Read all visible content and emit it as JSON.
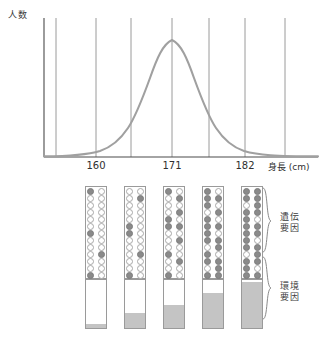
{
  "figure": {
    "y_axis_label": "人数",
    "x_axis_title": "身長 (cm)",
    "x_ticks": [
      "160",
      "171",
      "182"
    ]
  },
  "chart_data": {
    "type": "line",
    "title": "",
    "xlabel": "身長 (cm)",
    "ylabel": "人数",
    "grid": true,
    "legend": "none",
    "x_tick_labels": [
      "160",
      "171",
      "182"
    ],
    "x_tick_positions_px": [
      96,
      172,
      245
    ],
    "gridline_positions_px": [
      56,
      96,
      131,
      172,
      209,
      245,
      285
    ],
    "xlim": [
      140,
      202
    ],
    "ylim": [
      0,
      1
    ],
    "series": [
      {
        "name": "身長の分布",
        "color": "#a0a0a0",
        "x": [
          140,
          144,
          148,
          152,
          155,
          158,
          160,
          163,
          166,
          168,
          171,
          174,
          176,
          179,
          182,
          185,
          188,
          192,
          196,
          200
        ],
        "y": [
          0.005,
          0.012,
          0.025,
          0.055,
          0.1,
          0.19,
          0.27,
          0.46,
          0.68,
          0.85,
          1.0,
          0.9,
          0.76,
          0.51,
          0.3,
          0.16,
          0.08,
          0.025,
          0.009,
          0.004
        ]
      }
    ],
    "annotations": [
      "Normal distribution of human height",
      "Five sample columns below show genetic vs environmental contribution"
    ]
  },
  "columns": {
    "count": 5,
    "genetic": {
      "rows": 13,
      "dots_per_row": 2,
      "label_group": "遺伝要因",
      "filled_counts": [
        4,
        5,
        7,
        12,
        20
      ],
      "patterns": [
        [
          [
            1,
            0
          ],
          [
            0,
            0
          ],
          [
            0,
            0
          ],
          [
            0,
            0
          ],
          [
            0,
            0
          ],
          [
            0,
            0
          ],
          [
            1,
            0
          ],
          [
            0,
            0
          ],
          [
            0,
            0
          ],
          [
            0,
            1
          ],
          [
            0,
            0
          ],
          [
            0,
            0
          ],
          [
            1,
            0
          ]
        ],
        [
          [
            0,
            0
          ],
          [
            0,
            1
          ],
          [
            0,
            0
          ],
          [
            0,
            0
          ],
          [
            0,
            0
          ],
          [
            1,
            0
          ],
          [
            1,
            0
          ],
          [
            0,
            0
          ],
          [
            0,
            0
          ],
          [
            0,
            1
          ],
          [
            0,
            0
          ],
          [
            0,
            0
          ],
          [
            1,
            0
          ]
        ],
        [
          [
            1,
            0
          ],
          [
            0,
            1
          ],
          [
            0,
            0
          ],
          [
            0,
            1
          ],
          [
            1,
            0
          ],
          [
            1,
            1
          ],
          [
            0,
            0
          ],
          [
            0,
            1
          ],
          [
            0,
            0
          ],
          [
            1,
            0
          ],
          [
            0,
            1
          ],
          [
            0,
            0
          ],
          [
            1,
            0
          ]
        ],
        [
          [
            1,
            0
          ],
          [
            1,
            1
          ],
          [
            1,
            0
          ],
          [
            0,
            1
          ],
          [
            1,
            0
          ],
          [
            1,
            1
          ],
          [
            1,
            0
          ],
          [
            1,
            1
          ],
          [
            0,
            1
          ],
          [
            1,
            0
          ],
          [
            1,
            1
          ],
          [
            0,
            1
          ],
          [
            1,
            1
          ]
        ],
        [
          [
            1,
            1
          ],
          [
            1,
            1
          ],
          [
            0,
            1
          ],
          [
            1,
            1
          ],
          [
            1,
            0
          ],
          [
            1,
            1
          ],
          [
            1,
            1
          ],
          [
            1,
            0
          ],
          [
            1,
            1
          ],
          [
            0,
            1
          ],
          [
            1,
            1
          ],
          [
            1,
            0
          ],
          [
            1,
            1
          ]
        ]
      ]
    },
    "environmental": {
      "label_group": "環境要因",
      "fill_percents": [
        8,
        32,
        48,
        72,
        96
      ],
      "fill_color": "#c4c4c4"
    }
  },
  "side_labels": {
    "genetic": {
      "line1": "遺伝",
      "line2": "要因"
    },
    "environmental": {
      "line1": "環境",
      "line2": "要因"
    }
  },
  "colors": {
    "curve": "#a0a0a0",
    "gridline": "#8f8f8f",
    "axis": "#4a4a4a",
    "dot_filled": "#8a8a8a",
    "dot_empty": "#ffffff",
    "bar_fill": "#c4c4c4",
    "outline": "#9a9a9a"
  }
}
